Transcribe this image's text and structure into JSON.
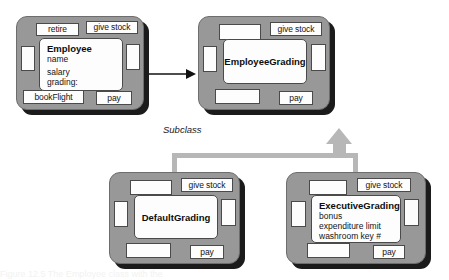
{
  "diagram": {
    "type": "uml-class-diagram",
    "subclass_label": "Subclass",
    "caption": "Figure 12.5   The Employee class with the",
    "colors": {
      "node_fill": "#989898",
      "node_border": "#6d6d6d",
      "shadow": "#1b1b1b",
      "port_fill": "#fdfdfd",
      "port_border": "#4a4a4a",
      "generalization": "#b7b7b7",
      "association": "#111111",
      "text": "#141414",
      "background": "#ffffff"
    }
  },
  "nodes": {
    "employee": {
      "name": "Employee",
      "attributes": [
        "name",
        "salary",
        "grading:"
      ],
      "ports": {
        "top_left": "retire",
        "top_right": "give stock",
        "left": "",
        "right": "",
        "bottom_left": "bookFlight",
        "bottom_right": "pay"
      }
    },
    "employee_grading": {
      "name": "EmployeeGrading",
      "attributes": [],
      "ports": {
        "top_left": "",
        "top_right": "give stock",
        "left": "",
        "right": "",
        "bottom_left": "",
        "bottom_right": "pay"
      }
    },
    "default_grading": {
      "name": "DefaultGrading",
      "attributes": [],
      "ports": {
        "top_left": "",
        "top_right": "give stock",
        "left": "",
        "right": "",
        "bottom_left": "",
        "bottom_right": "pay"
      }
    },
    "executive_grading": {
      "name": "ExecutiveGrading",
      "attributes": [
        "bonus",
        "expenditure limit",
        "washroom key #"
      ],
      "ports": {
        "top_left": "",
        "top_right": "give stock",
        "left": "",
        "right": "",
        "bottom_left": "",
        "bottom_right": "pay"
      }
    }
  }
}
